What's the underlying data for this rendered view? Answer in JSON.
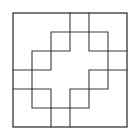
{
  "figure": {
    "type": "line-diagram",
    "canvas": {
      "width": 140,
      "height": 137,
      "background": "#ffffff"
    },
    "style": {
      "stroke_color": "#3a3a3a",
      "border_stroke_color": "#2e2e2e",
      "stroke_width": 1.1,
      "border_stroke_width": 1.25,
      "fill": "none"
    },
    "grid": {
      "origin_x": 13,
      "origin_y": 13,
      "cell_size": 19,
      "columns": 6,
      "rows": 6,
      "x_lines": [
        13,
        32,
        51,
        70,
        89,
        108,
        127
      ],
      "y_lines": [
        13,
        32,
        51,
        70,
        89,
        108,
        127
      ],
      "visible": false
    },
    "outer_border": {
      "name": "outer-square",
      "x": 13,
      "y": 13,
      "width": 114,
      "height": 114
    },
    "paths": [
      {
        "name": "center-cross",
        "label": "Central plus shape",
        "d": "M 51 70 L 51 51 L 70 51 L 70 32 L 89 32 L 89 51 L 108 51 L 108 70 L 89 70 L 89 89 L 70 89 L 70 108 L 51 108 L 51 89 L 32 89 L 32 70 Z"
      },
      {
        "name": "upper-left-cross-arm",
        "label": "Upper-left notch boundary",
        "d": "M 13 70 L 32 70 L 32 51 L 51 51 L 51 32 L 70 32 L 70 13"
      },
      {
        "name": "upper-right-cross-arm",
        "label": "Upper-right notch boundary",
        "d": "M 127 51 L 108 51 L 108 32 L 89 32 L 89 13"
      },
      {
        "name": "lower-left-cross-arm",
        "label": "Lower-left notch boundary",
        "d": "M 13 89 L 32 89 L 32 108 L 51 108 L 51 127"
      },
      {
        "name": "lower-right-cross-arm",
        "label": "Lower-right notch boundary",
        "d": "M 127 70 L 108 70 L 108 89 L 89 89 L 89 108 L 70 108 L 70 127"
      }
    ]
  }
}
